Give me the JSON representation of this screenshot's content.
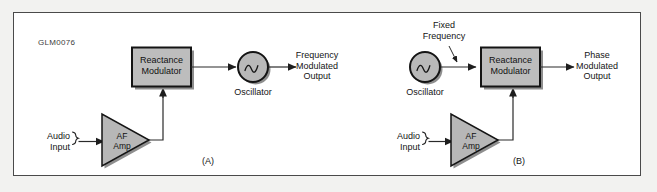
{
  "figure": {
    "id_code": "GLM0076",
    "background_color": "#f2f2f0",
    "page_color": "#ffffff",
    "border_color": "#4a4a4a",
    "block_fill": "#b4b4b4",
    "block_stroke": "#1a1a1a",
    "shadow_color": "#8c8c8c",
    "line_color": "#2a2a2a",
    "text_color": "#141414"
  },
  "panels": [
    {
      "tag": "(A)",
      "input_label": "Audio\nInput",
      "amp_label": "AF\nAmp",
      "modulator_label": "Reactance\nModulator",
      "oscillator_label": "Oscillator",
      "output_label": "Frequency\nModulated\nOutput",
      "oscillator_symbol": "sine-wave"
    },
    {
      "tag": "(B)",
      "input_label": "Audio\nInput",
      "amp_label": "AF\nAmp",
      "modulator_label": "Reactance\nModulator",
      "oscillator_label": "Oscillator",
      "annotation_label": "Fixed\nFrequency",
      "output_label": "Phase\nModulated\nOutput",
      "oscillator_symbol": "sine-wave"
    }
  ],
  "icons": {
    "oscillator": "sine-wave-icon",
    "amplifier": "triangle-amp-icon",
    "terminal": "input-terminal-icon",
    "arrow": "arrowhead-icon",
    "pointer": "annotation-pointer-icon"
  }
}
